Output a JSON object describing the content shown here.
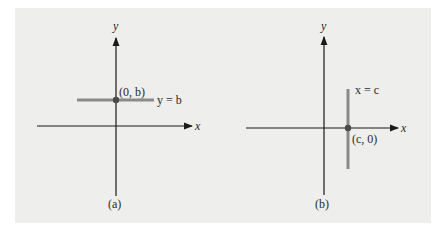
{
  "figure": {
    "panels": [
      {
        "caption": "(a)",
        "x_axis_label": "x",
        "y_axis_label": "y",
        "point_label": "(0, b)",
        "line_label": "y = b",
        "line_type": "horizontal"
      },
      {
        "caption": "(b)",
        "x_axis_label": "x",
        "y_axis_label": "y",
        "point_label": "(c, 0)",
        "line_label": "x = c",
        "line_type": "vertical"
      }
    ],
    "colors": {
      "background": "#eeeeec",
      "axis": "#1a1a1a",
      "line": "#8a8a8a",
      "point": "#4a4a4a"
    }
  }
}
